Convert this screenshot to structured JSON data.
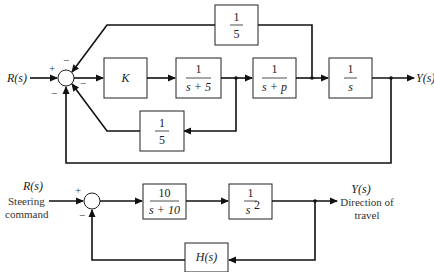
{
  "diagram_top": {
    "input_label": "R(s)",
    "output_label": "Y(s)",
    "summing_junction": {
      "signs": {
        "input": "+",
        "top": "−",
        "bottom_left": "−",
        "right_inner": "−"
      }
    },
    "blocks": {
      "gain_K": {
        "text": "K"
      },
      "first_order_5": {
        "num": "1",
        "den": "s + 5"
      },
      "first_order_p": {
        "num": "1",
        "den": "s + p"
      },
      "integrator": {
        "num": "1",
        "den": "s"
      },
      "top_feedback": {
        "num": "1",
        "den": "5"
      },
      "inner_feedback": {
        "num": "1",
        "den": "5"
      }
    }
  },
  "diagram_bottom": {
    "input_label": "R(s)",
    "input_desc_1": "Steering",
    "input_desc_2": "command",
    "output_label": "Y(s)",
    "output_desc_1": "Direction of",
    "output_desc_2": "travel",
    "summing_junction": {
      "signs": {
        "input": "+",
        "feedback": "−"
      }
    },
    "blocks": {
      "controller": {
        "num": "10",
        "den": "s + 10"
      },
      "plant": {
        "num": "1",
        "den": "s",
        "den_exp": "2"
      },
      "feedback": {
        "text": "H(s)"
      }
    }
  }
}
